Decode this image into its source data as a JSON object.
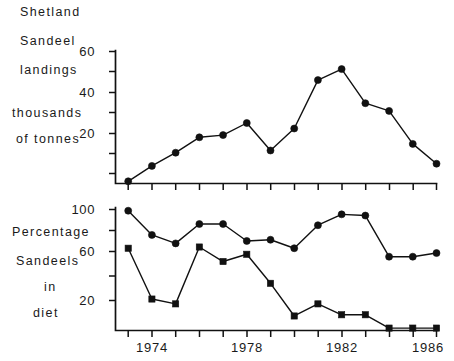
{
  "figure": {
    "background_color": "#ffffff",
    "ink_color": "#111111",
    "panels": [
      {
        "id": "landings",
        "caption_lines": [
          "Shetland",
          "Sandeel",
          "landings",
          "",
          "thousands",
          "of tonnes"
        ]
      },
      {
        "id": "diet",
        "caption_lines": [
          "Percentage",
          "Sandeels",
          "in",
          "diet"
        ]
      }
    ]
  },
  "chart_data": [
    {
      "type": "line",
      "id": "shetland-sandeel-landings",
      "title": "Shetland Sandeel landings",
      "xlabel": "",
      "ylabel": "thousands of tonnes",
      "ylim": [
        0,
        60
      ],
      "yticks": [
        20,
        40,
        60
      ],
      "ytick_labels": [
        "20",
        "40",
        "60"
      ],
      "xlim": [
        1973,
        1986
      ],
      "xticks": [
        1974,
        1978,
        1982,
        1986
      ],
      "xtick_labels": [
        "1974",
        "1978",
        "1982",
        "1986"
      ],
      "grid": false,
      "legend": "none",
      "marker": "circle",
      "x": [
        1973,
        1974,
        1975,
        1976,
        1977,
        1978,
        1979,
        1980,
        1981,
        1982,
        1983,
        1984,
        1985,
        1986
      ],
      "values": [
        1,
        8,
        14,
        21,
        22,
        27.5,
        15,
        25,
        47,
        52,
        36.5,
        33,
        18,
        9
      ]
    },
    {
      "type": "line",
      "id": "percentage-sandeels-in-diet",
      "title": "Percentage Sandeels in diet",
      "xlabel": "",
      "ylabel": "Percentage Sandeels in diet",
      "ylim": [
        0,
        100
      ],
      "yticks": [
        20,
        60,
        100
      ],
      "ytick_labels": [
        "20",
        "60",
        "100"
      ],
      "xlim": [
        1973,
        1986
      ],
      "xticks": [
        1974,
        1978,
        1982,
        1986
      ],
      "xtick_labels": [
        "1974",
        "1978",
        "1982",
        "1986"
      ],
      "grid": false,
      "legend": "none",
      "categories": [
        1973,
        1974,
        1975,
        1976,
        1977,
        1978,
        1979,
        1980,
        1981,
        1982,
        1983,
        1984,
        1985,
        1986
      ],
      "series": [
        {
          "name": "upper-series",
          "marker": "circle",
          "values": [
            99,
            79,
            72,
            88,
            88,
            74,
            75,
            68,
            87,
            96,
            95,
            61,
            61,
            64
          ]
        },
        {
          "name": "lower-series",
          "marker": "square",
          "values": [
            68,
            26,
            22,
            69,
            57,
            63,
            39,
            12,
            22,
            13,
            13,
            2,
            2,
            2
          ]
        }
      ]
    }
  ],
  "axes": {
    "top": {
      "y_tick_labels": [
        "60",
        "40",
        "20"
      ],
      "x_tick_labels": []
    },
    "bottom": {
      "y_tick_labels": [
        "100",
        "60",
        "20"
      ],
      "x_tick_labels": [
        "1974",
        "1978",
        "1982",
        "1986"
      ]
    }
  },
  "labels": {
    "top_caption": {
      "l1": "Shetland",
      "l2": "Sandeel",
      "l3": "landings",
      "l4": "thousands",
      "l5": "of tonnes"
    },
    "bottom_caption": {
      "l1": "Percentage",
      "l2": "Sandeels",
      "l3": "in",
      "l4": "diet"
    }
  }
}
